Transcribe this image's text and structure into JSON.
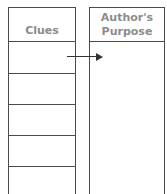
{
  "diagram": {
    "left_column": {
      "header": "Clues",
      "rows": 5
    },
    "right_column": {
      "header_line1": "Author's",
      "header_line2": "Purpose"
    },
    "arrow": {
      "from": "Clues",
      "to": "Author's Purpose",
      "direction": "right"
    },
    "colors": {
      "border": "#4a4a4a",
      "header_text": "#8c8c8c",
      "arrow": "#333333",
      "background": "#ffffff"
    }
  }
}
